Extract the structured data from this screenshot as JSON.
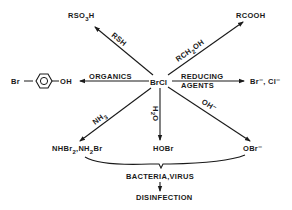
{
  "diagram": {
    "center": "BrCl",
    "products": {
      "rso3h": {
        "main": "RSO",
        "sub": "3",
        "tail": "H"
      },
      "rcooh": "RCOOH",
      "bromophenol_left": "Br",
      "bromophenol_right": "OH",
      "halides": "Br⁻, Cl⁻",
      "bromamines_a": "NHBr",
      "bromamines_a_sub": "2",
      "bromamines_b": ",NH",
      "bromamines_b_sub": "2",
      "bromamines_c": "Br",
      "hobr": "HOBr",
      "obr": "OBr⁻"
    },
    "reagents": {
      "rsh": "RSH",
      "rch2oh_a": "RCH",
      "rch2oh_sub": "2",
      "rch2oh_b": "OH",
      "organics": "ORGANICS",
      "reducing_1": "REDUCING",
      "reducing_2": "AGENTS",
      "nh3_a": "NH",
      "nh3_sub": "3",
      "h2o_a": "H",
      "h2o_sub": "2",
      "h2o_b": "O",
      "oh": "OH⁻"
    },
    "targets": "BACTERIA,VIRUS",
    "outcome": "DISINFECTION",
    "colors": {
      "ink": "#1a1a1a",
      "background": "#ffffff"
    }
  }
}
